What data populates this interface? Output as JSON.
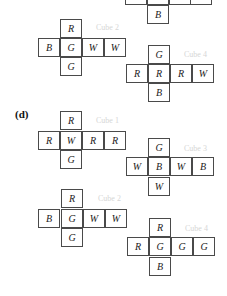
{
  "figure": {
    "top_partial": {
      "row_cells": [
        "",
        "",
        "",
        ""
      ],
      "bottom_cell": "B"
    },
    "part_c_lower": {
      "cube2": {
        "label": "Cube 2",
        "top": "R",
        "row": [
          "B",
          "G",
          "W",
          "W"
        ],
        "bottom": "G"
      },
      "cube4": {
        "label": "Cube 4",
        "top": "G",
        "row": [
          "R",
          "R",
          "R",
          "W"
        ],
        "bottom": "B"
      }
    },
    "part_d": {
      "section_label": "(d)",
      "cube1": {
        "label": "Cube 1",
        "top": "R",
        "row": [
          "R",
          "W",
          "R",
          "R"
        ],
        "bottom": "G"
      },
      "cube3": {
        "label": "Cube 3",
        "top": "G",
        "row": [
          "W",
          "B",
          "W",
          "B"
        ],
        "bottom": "W"
      },
      "cube2": {
        "label": "Cube 2",
        "top": "R",
        "row": [
          "B",
          "G",
          "W",
          "W"
        ],
        "bottom": "G"
      },
      "cube4": {
        "label": "Cube 4",
        "top": "R",
        "row": [
          "R",
          "G",
          "G",
          "G"
        ],
        "bottom": "B"
      }
    }
  }
}
